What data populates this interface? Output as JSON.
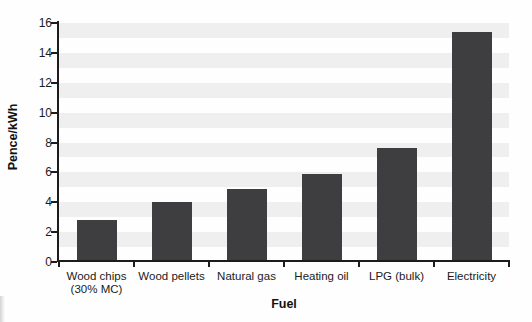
{
  "chart_data": {
    "type": "bar",
    "title": "",
    "xlabel": "Fuel",
    "ylabel": "Pence/kWh",
    "categories": [
      "Wood chips\n(30% MC)",
      "Wood pellets",
      "Natural gas",
      "Heating oil",
      "LPG (bulk)",
      "Electricity"
    ],
    "values": [
      2.8,
      4.0,
      4.9,
      5.9,
      7.6,
      15.4
    ],
    "ylim": [
      0,
      16
    ],
    "yticks": [
      0,
      2,
      4,
      6,
      8,
      10,
      12,
      14,
      16
    ],
    "grid": "horizontal alternating bands, 1 unit tall",
    "legend": "none",
    "colors": {
      "bar": "#3e3e40",
      "band": "#efefef",
      "axis": "#1c1c1c",
      "background": "#fefefe"
    }
  }
}
